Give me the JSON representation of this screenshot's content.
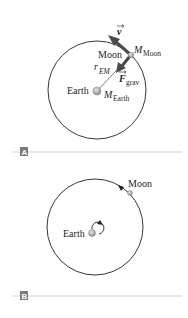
{
  "figure": {
    "panels": [
      {
        "id": "A",
        "tag": "A",
        "labels": {
          "velocity": "v",
          "moon": "Moon",
          "moon_mass_main": "M",
          "moon_mass_sub": "Moon",
          "radius_main": "r",
          "radius_sub": "EM",
          "force_main": "F",
          "force_sub": "grav",
          "earth": "Earth",
          "earth_mass_main": "M",
          "earth_mass_sub": "Earth"
        }
      },
      {
        "id": "B",
        "tag": "B",
        "labels": {
          "moon": "Moon",
          "earth": "Earth"
        }
      }
    ],
    "colors": {
      "line": "#231f20",
      "arrow": "#4a4a4a",
      "body_fill": "#bdbdbd",
      "divider": "#c8c8c8",
      "tag_bg": "#7a7a7a"
    }
  }
}
